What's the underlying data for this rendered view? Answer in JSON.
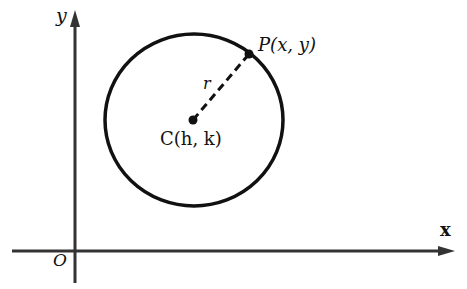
{
  "diagram": {
    "axes": {
      "x_label": "x",
      "y_label": "y",
      "origin_label": "O"
    },
    "circle": {
      "center_label": "C(h, k)",
      "point_label": "P(x, y)",
      "radius_label": "r"
    },
    "colors": {
      "stroke": "#111111",
      "axis": "#333333",
      "background": "#ffffff"
    }
  }
}
